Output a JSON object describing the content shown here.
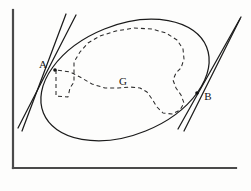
{
  "figure": {
    "kind": "geometry-diagram",
    "background_color": "#fdfdfc",
    "stroke_color": "#1b1b1b",
    "axis_color": "#4a4a4a",
    "labels": {
      "tangent_point_left": "A",
      "tangent_point_right": "B",
      "region": "G"
    },
    "label_positions": {
      "tangent_point_left": {
        "x": 43,
        "y": 65
      },
      "tangent_point_right": {
        "x": 208,
        "y": 97
      },
      "region": {
        "x": 123,
        "y": 82
      }
    },
    "axes": {
      "origin": {
        "x": 13,
        "y": 168
      },
      "y_axis_top": {
        "x": 13,
        "y": 10
      },
      "x_axis_right": {
        "x": 236,
        "y": 168
      }
    },
    "ellipse": {
      "center": {
        "x": 125,
        "y": 80
      },
      "radius_x": 88,
      "radius_y": 55,
      "rotation_deg": -22
    },
    "tangents": [
      {
        "name": "tangent-at-A",
        "touch_point": {
          "x": 55,
          "y": 70
        },
        "start": {
          "x": 18,
          "y": 128
        },
        "end": {
          "x": 76,
          "y": 15
        }
      },
      {
        "name": "tangent-at-A-secondary",
        "touch_point": {
          "x": 55,
          "y": 70
        },
        "start": {
          "x": 22,
          "y": 131
        },
        "end": {
          "x": 66,
          "y": 14
        }
      },
      {
        "name": "tangent-at-B",
        "touch_point": {
          "x": 197,
          "y": 93
        },
        "start": {
          "x": 178,
          "y": 129
        },
        "end": {
          "x": 241,
          "y": 17
        }
      },
      {
        "name": "tangent-at-B-secondary",
        "touch_point": {
          "x": 197,
          "y": 93
        },
        "start": {
          "x": 184,
          "y": 131
        },
        "end": {
          "x": 240,
          "y": 19
        }
      }
    ],
    "dashed_region": {
      "name": "inner-set-G",
      "path": "M 56 70 L 56 96 L 68 97 L 70 88 L 74 82 L 74 62 L 80 52 L 88 43 L 100 36 L 116 31 L 134 28 L 152 29 L 166 33 L 177 40 L 183 49 L 184 59 L 181 68 L 176 73 L 173 80 L 176 88 L 181 95 L 184 103 L 180 110 L 172 114 L 163 113 L 157 107 L 152 99 L 147 92 L 140 88 L 130 87 L 118 88 L 105 88 L 92 84 L 80 77 L 70 72 Z"
    }
  }
}
